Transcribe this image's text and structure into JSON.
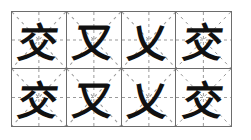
{
  "sheet": {
    "type": "米字格 calligraphy practice grid",
    "border_color": "#6d6d6d",
    "guide_color": "#9a9a9a",
    "ink_color": "#111111",
    "rows": [
      {
        "cells": [
          {
            "char": "交",
            "stage": "partial"
          },
          {
            "char": "又",
            "stage": "partial"
          },
          {
            "char": "乂",
            "stage": "partial"
          },
          {
            "char": "交",
            "stage": "complete"
          }
        ]
      },
      {
        "cells": [
          {
            "char": "交",
            "stage": "partial"
          },
          {
            "char": "又",
            "stage": "partial"
          },
          {
            "char": "乂",
            "stage": "partial"
          },
          {
            "char": "交",
            "stage": "complete"
          }
        ]
      }
    ]
  }
}
